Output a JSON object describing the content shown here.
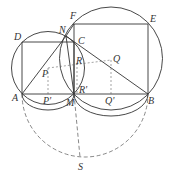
{
  "diagram": {
    "colors": {
      "line": "#333333",
      "dashed": "#555555",
      "background": "#ffffff"
    },
    "points": {
      "A": {
        "label": "A",
        "x": 22,
        "y": 94
      },
      "M": {
        "label": "M",
        "x": 74,
        "y": 94
      },
      "B": {
        "label": "B",
        "x": 148,
        "y": 94
      },
      "D": {
        "label": "D",
        "x": 22,
        "y": 42
      },
      "C": {
        "label": "C",
        "x": 74,
        "y": 42
      },
      "F": {
        "label": "F",
        "x": 74,
        "y": 24
      },
      "E": {
        "label": "E",
        "x": 148,
        "y": 24
      },
      "N": {
        "label": "N",
        "x": 66,
        "y": 36
      },
      "P": {
        "label": "P",
        "x": 48,
        "y": 68
      },
      "P_prime": {
        "label": "P'",
        "x": 48,
        "y": 94
      },
      "Q": {
        "label": "Q",
        "x": 111,
        "y": 60
      },
      "Q_prime": {
        "label": "Q'",
        "x": 111,
        "y": 94
      },
      "R": {
        "label": "R",
        "x": 77,
        "y": 63
      },
      "R_prime": {
        "label": "R'",
        "x": 77,
        "y": 94
      },
      "S": {
        "label": "S",
        "x": 80,
        "y": 157
      }
    },
    "labels": {
      "A": "A",
      "M": "M",
      "B": "B",
      "D": "D",
      "C": "C",
      "F": "F",
      "E": "E",
      "N": "N",
      "P": "P",
      "P_prime": "P'",
      "Q": "Q",
      "Q_prime": "Q'",
      "R": "R",
      "R_prime": "R'",
      "S": "S"
    }
  }
}
